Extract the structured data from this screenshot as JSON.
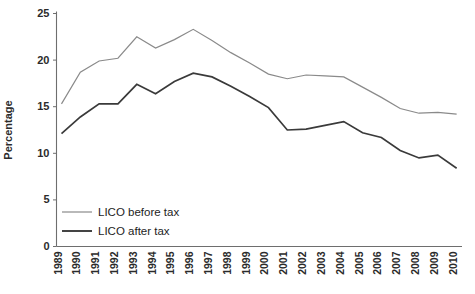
{
  "chart_data": {
    "type": "line",
    "title": "",
    "xlabel": "",
    "ylabel": "Percentage",
    "ylim": [
      0,
      25
    ],
    "yticks": [
      0,
      5,
      10,
      15,
      20,
      25
    ],
    "grid": false,
    "legend_position": "bottom-left",
    "categories": [
      "1989",
      "1990",
      "1991",
      "1992",
      "1993",
      "1994",
      "1995",
      "1996",
      "1997",
      "1998",
      "1999",
      "2000",
      "2001",
      "2002",
      "2003",
      "2004",
      "2005",
      "2006",
      "2007",
      "2008",
      "2009",
      "2010"
    ],
    "series": [
      {
        "name": "LICO before tax",
        "color": "#8a8a8a",
        "values": [
          15.3,
          18.7,
          19.9,
          20.2,
          22.5,
          21.3,
          22.2,
          23.3,
          22.1,
          20.8,
          19.7,
          18.5,
          18.0,
          18.4,
          18.3,
          18.2,
          17.1,
          16.0,
          14.8,
          14.3,
          14.4,
          14.2
        ]
      },
      {
        "name": "LICO after tax",
        "color": "#3a3a3a",
        "values": [
          12.1,
          13.9,
          15.3,
          15.3,
          17.4,
          16.4,
          17.7,
          18.6,
          18.2,
          17.2,
          16.1,
          14.9,
          12.5,
          12.6,
          13.0,
          13.4,
          12.2,
          11.7,
          10.3,
          9.5,
          9.8,
          8.4
        ]
      }
    ]
  },
  "legend": {
    "items": [
      {
        "label": "LICO before tax"
      },
      {
        "label": "LICO after tax"
      }
    ]
  }
}
